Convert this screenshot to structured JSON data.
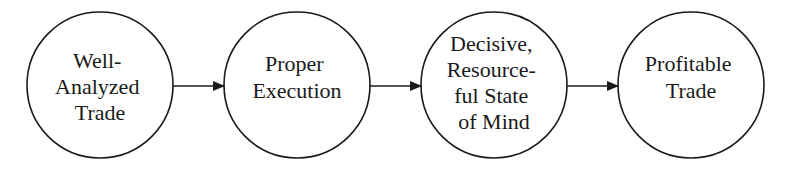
{
  "diagram": {
    "type": "flow",
    "nodes": [
      {
        "id": "n1",
        "lines": [
          "Well-",
          "Analyzed",
          "Trade"
        ],
        "cx": 100,
        "cy": 85,
        "r": 73
      },
      {
        "id": "n2",
        "lines": [
          "Proper",
          "Execution"
        ],
        "cx": 297,
        "cy": 85,
        "r": 73
      },
      {
        "id": "n3",
        "lines": [
          "Decisive,",
          "Resource-",
          "ful State",
          "of Mind"
        ],
        "cx": 494,
        "cy": 85,
        "r": 73
      },
      {
        "id": "n4",
        "lines": [
          "Profitable",
          "Trade"
        ],
        "cx": 691,
        "cy": 85,
        "r": 73
      }
    ],
    "edges": [
      {
        "from": "n1",
        "to": "n2"
      },
      {
        "from": "n2",
        "to": "n3"
      },
      {
        "from": "n3",
        "to": "n4"
      }
    ],
    "stroke_color": "#1a1a1a",
    "background": "#ffffff"
  }
}
